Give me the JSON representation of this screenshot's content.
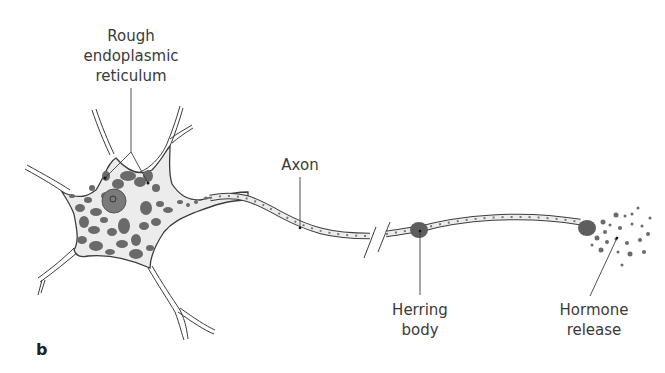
{
  "figure": {
    "panel_letter": "b"
  },
  "labels": {
    "rer_line1": "Rough",
    "rer_line2": "endoplasmic",
    "rer_line3": "reticulum",
    "axon": "Axon",
    "herring_line1": "Herring",
    "herring_line2": "body",
    "hormone_line1": "Hormone",
    "hormone_line2": "release"
  },
  "colors": {
    "outline": "#3c3c3c",
    "cytoplasm": "#ececec",
    "granules": "#6a6a6a",
    "nucleus": "#7a7a7a",
    "text": "#3a3a3a"
  }
}
